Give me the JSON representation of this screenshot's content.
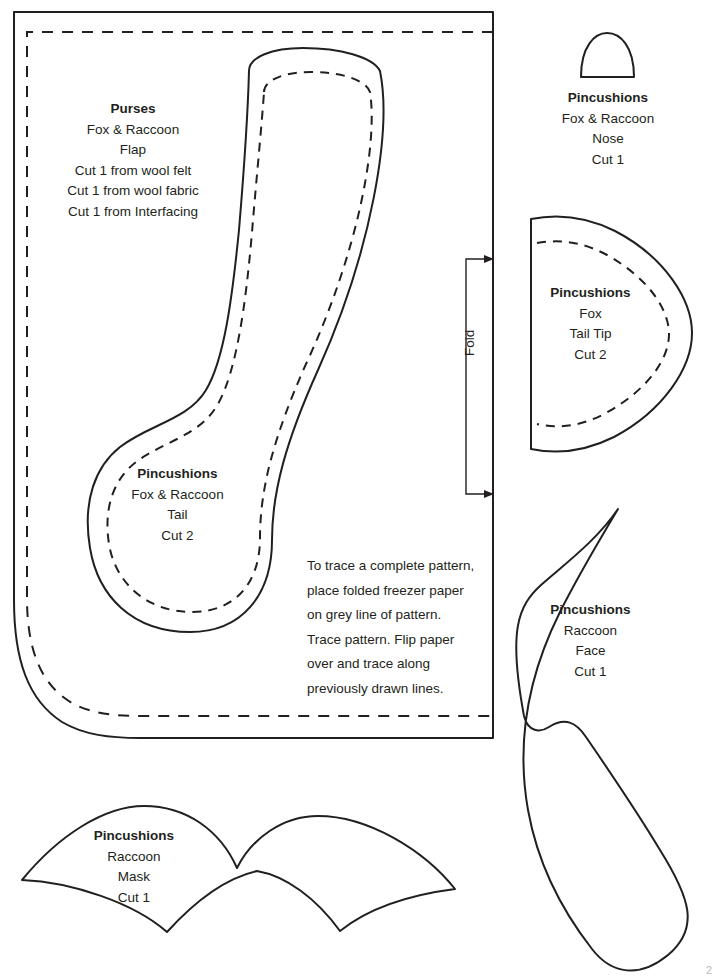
{
  "document": {
    "kind": "sewing-pattern-sheet",
    "page_number": "2"
  },
  "pieces": {
    "flap": {
      "title": "Purses",
      "line1": "Fox & Raccoon",
      "line2": "Flap",
      "line3": "Cut 1 from wool felt",
      "line4": "Cut 1 from wool fabric",
      "line5": "Cut 1 from Interfacing"
    },
    "tail": {
      "title": "Pincushions",
      "line1": "Fox & Raccoon",
      "line2": "Tail",
      "line3": "Cut 2"
    },
    "nose": {
      "title": "Pincushions",
      "line1": "Fox & Raccoon",
      "line2": "Nose",
      "line3": "Cut 1"
    },
    "tail_tip": {
      "title": "Pincushions",
      "line1": "Fox",
      "line2": "Tail Tip",
      "line3": "Cut 2"
    },
    "face": {
      "title": "Pincushions",
      "line1": "Raccoon",
      "line2": "Face",
      "line3": "Cut 1"
    },
    "mask": {
      "title": "Pincushions",
      "line1": "Raccoon",
      "line2": "Mask",
      "line3": "Cut 1"
    }
  },
  "annotations": {
    "fold_label": "Fold",
    "trace_note": {
      "l1": "To trace a complete pattern,",
      "l2": "place folded freezer paper",
      "l3": "on grey line of pattern.",
      "l4": "Trace pattern. Flip paper",
      "l5": "over and trace along",
      "l6": "previously drawn lines."
    }
  },
  "colors": {
    "ink": "#231f20",
    "paper": "#ffffff",
    "page_number": "#b9b9b9"
  }
}
